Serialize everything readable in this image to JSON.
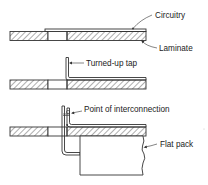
{
  "diagram": {
    "type": "cross-section",
    "stages": [
      {
        "id": "stage-1",
        "labels": {
          "circuitry": "Circuitry",
          "laminate": "Laminate"
        }
      },
      {
        "id": "stage-2",
        "labels": {
          "tap": "Turned-up tap"
        }
      },
      {
        "id": "stage-3",
        "labels": {
          "interconnection": "Point of interconnection",
          "flat_pack": "Flat pack"
        }
      }
    ]
  },
  "colors": {
    "line": "#333333",
    "background": "#ffffff"
  }
}
